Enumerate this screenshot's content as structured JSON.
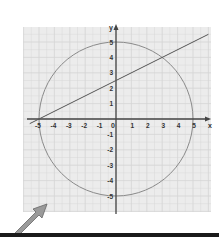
{
  "chart_data": {
    "type": "line",
    "title": "",
    "xlabel": "x",
    "ylabel": "y",
    "xlim": [
      -5.6,
      6
    ],
    "ylim": [
      -6,
      6
    ],
    "grid": true,
    "x_ticks": [
      -5,
      -4,
      -3,
      -2,
      -1,
      0,
      1,
      2,
      3,
      4,
      5
    ],
    "y_ticks": [
      -5,
      -4,
      -3,
      -2,
      -1,
      1,
      2,
      3,
      4,
      5
    ],
    "series": [
      {
        "name": "circle",
        "shape": "circle",
        "center": [
          0,
          0
        ],
        "radius": 5,
        "equation": "x^2 + y^2 = 25"
      },
      {
        "name": "line",
        "shape": "line",
        "slope": 0.5,
        "intercept": 2.5,
        "equation": "y = 0.5x + 2.5",
        "points": [
          [
            -5,
            0
          ],
          [
            3,
            4
          ]
        ],
        "x_range": [
          -5.6,
          6
        ]
      }
    ],
    "intersections": [
      [
        -5,
        0
      ],
      [
        3,
        4
      ]
    ]
  },
  "axes": {
    "x_label": "x",
    "y_label": "y",
    "origin_label": "0",
    "x_tick_labels": [
      "-5",
      "-4",
      "-3",
      "-2",
      "-1",
      "1",
      "2",
      "3",
      "4",
      "5"
    ],
    "y_tick_labels": [
      "5",
      "4",
      "3",
      "2",
      "1",
      "-1",
      "-2",
      "-3",
      "-4",
      "-5"
    ]
  },
  "colors": {
    "grid_bg": "#ececec",
    "grid_line": "#d4d4d4",
    "axis": "#444444",
    "circle": "#8a8a8a",
    "line": "#555555",
    "pointer_arrow": "#9a9a9a",
    "bottom_bar": "#1a1a1a"
  },
  "annotation": {
    "pointer_arrow": "arrow-up-right"
  }
}
